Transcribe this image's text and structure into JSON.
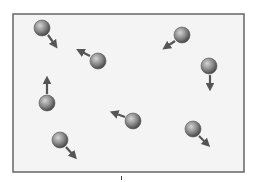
{
  "diagram": {
    "title": "",
    "container": {
      "x": 13,
      "y": 14,
      "width": 231,
      "height": 158,
      "fill": "#f4f4f4",
      "border": "#666666"
    },
    "ball_color": {
      "light": "#c9c9c9",
      "mid": "#8a8a8a",
      "dark": "#4e4e4e"
    },
    "arrow_color": "#555555",
    "particles": [
      {
        "id": 1,
        "cx": 42,
        "cy": 28,
        "r": 8,
        "arrow": {
          "x1": 48,
          "y1": 35,
          "x2": 55,
          "y2": 45
        }
      },
      {
        "id": 2,
        "cx": 98,
        "cy": 61,
        "r": 8,
        "arrow": {
          "x1": 90,
          "y1": 56,
          "x2": 80,
          "y2": 51
        }
      },
      {
        "id": 3,
        "cx": 182,
        "cy": 35,
        "r": 8,
        "arrow": {
          "x1": 175,
          "y1": 41,
          "x2": 166,
          "y2": 47
        }
      },
      {
        "id": 4,
        "cx": 209,
        "cy": 66,
        "r": 8,
        "arrow": {
          "x1": 210,
          "y1": 75,
          "x2": 210,
          "y2": 87
        }
      },
      {
        "id": 5,
        "cx": 47,
        "cy": 103,
        "r": 8,
        "arrow": {
          "x1": 47,
          "y1": 94,
          "x2": 47,
          "y2": 80
        }
      },
      {
        "id": 6,
        "cx": 133,
        "cy": 121,
        "r": 8,
        "arrow": {
          "x1": 125,
          "y1": 117,
          "x2": 114,
          "y2": 113
        }
      },
      {
        "id": 7,
        "cx": 60,
        "cy": 140,
        "r": 8,
        "arrow": {
          "x1": 66,
          "y1": 147,
          "x2": 74,
          "y2": 156
        }
      },
      {
        "id": 8,
        "cx": 193,
        "cy": 129,
        "r": 8,
        "arrow": {
          "x1": 199,
          "y1": 136,
          "x2": 207,
          "y2": 144
        }
      }
    ]
  }
}
